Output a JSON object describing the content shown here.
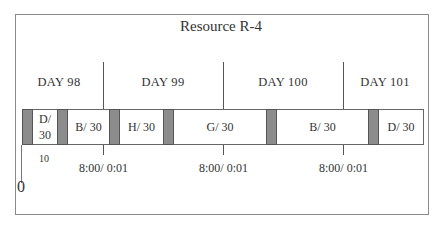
{
  "title": "Resource R-4",
  "days": [
    {
      "label": "DAY 98",
      "center_x": 59
    },
    {
      "label": "DAY 99",
      "center_x": 163
    },
    {
      "label": "DAY 100",
      "center_x": 283
    },
    {
      "label": "DAY 101",
      "center_x": 385
    }
  ],
  "tasks": [
    {
      "label": "D/ 30",
      "line1": "D/",
      "line2": "30"
    },
    {
      "label": "B/ 30"
    },
    {
      "label": "H/ 30"
    },
    {
      "label": "G/ 30"
    },
    {
      "label": "B/ 30"
    },
    {
      "label": "D/ 30"
    }
  ],
  "axis": {
    "origin_label": "0",
    "first_tick_label": "10",
    "day_boundary_labels": [
      "8:00/ 0:01",
      "8:00/ 0:01",
      "8:00/ 0:01"
    ]
  },
  "colors": {
    "setup_block": "#8c8c8c",
    "border": "#666666",
    "text": "#333333"
  }
}
